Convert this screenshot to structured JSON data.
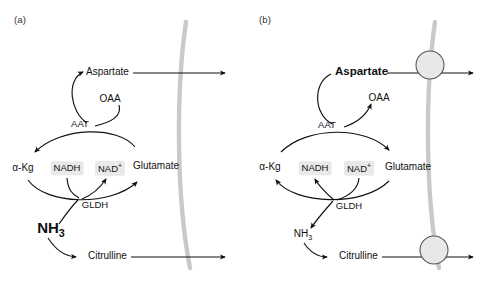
{
  "figure": {
    "membrane_color": "#c9c9c9",
    "arrow_color": "#111111",
    "cofactor_highlight_color": "#e9e9e9",
    "transporter_fill": "#e8e8e8",
    "transporter_stroke": "#555555"
  },
  "panels": [
    {
      "id": "a",
      "label": "(a)",
      "nodes": {
        "aspartate": "Aspartate",
        "oaa": "OAA",
        "aat": "AAT",
        "akg": "α-Kg",
        "nadh": "NADH",
        "nad": "NAD",
        "nad_charge": "+",
        "glutamate": "Glutamate",
        "gldh": "GLDH",
        "nh3": "NH",
        "nh3_sub": "3",
        "citrulline": "Citrulline"
      },
      "emphasis": "NH3",
      "has_transporters": false,
      "flow": {
        "aat_direction": "glutamate-to-aspartate",
        "oaa_role": "consumed",
        "gldh_direction": "akg-to-glutamate",
        "nadh_role": "consumed",
        "nad_role": "produced",
        "nh3_role": "consumed"
      }
    },
    {
      "id": "b",
      "label": "(b)",
      "nodes": {
        "aspartate": "Aspartate",
        "oaa": "OAA",
        "aat": "AAT",
        "akg": "α-Kg",
        "nadh": "NADH",
        "nad": "NAD",
        "nad_charge": "+",
        "glutamate": "Glutamate",
        "gldh": "GLDH",
        "nh3": "NH",
        "nh3_sub": "3",
        "citrulline": "Citrulline"
      },
      "emphasis": "Aspartate",
      "has_transporters": true,
      "flow": {
        "aat_direction": "aspartate-to-glutamate",
        "oaa_role": "produced",
        "gldh_direction": "glutamate-to-akg",
        "nadh_role": "produced",
        "nad_role": "consumed",
        "nh3_role": "produced"
      }
    }
  ]
}
